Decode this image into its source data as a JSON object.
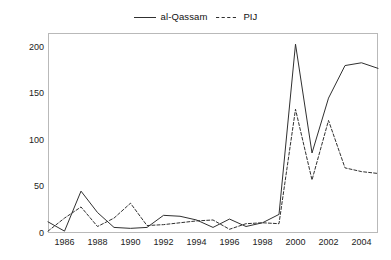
{
  "chart_data": {
    "type": "line",
    "title": "",
    "subtitle": "",
    "xlabel": "",
    "ylabel": "",
    "xlim": [
      1985,
      2005
    ],
    "ylim": [
      0,
      215
    ],
    "grid": false,
    "legend_position": "top-center",
    "x": [
      1985,
      1986,
      1987,
      1988,
      1989,
      1990,
      1991,
      1992,
      1993,
      1994,
      1995,
      1996,
      1997,
      1998,
      1999,
      2000,
      2001,
      2002,
      2003,
      2004,
      2005
    ],
    "xticks": [
      1986,
      1988,
      1990,
      1992,
      1994,
      1996,
      1998,
      2000,
      2002,
      2004
    ],
    "xtick_labels": [
      "1986",
      "1988",
      "1990",
      "1992",
      "1994",
      "1996",
      "1998",
      "2000",
      "2002",
      "2004"
    ],
    "yticks": [
      0,
      50,
      100,
      150,
      200
    ],
    "ytick_labels": [
      "0",
      "50",
      "100",
      "150",
      "200"
    ],
    "series": [
      {
        "name": "al-Qassam",
        "style": "solid",
        "color": "#303030",
        "values": [
          12,
          2,
          45,
          22,
          6,
          5,
          6,
          19,
          18,
          14,
          6,
          15,
          7,
          11,
          20,
          203,
          86,
          145,
          180,
          183,
          177
        ]
      },
      {
        "name": "PIJ",
        "style": "dashed",
        "color": "#303030",
        "values": [
          2,
          16,
          28,
          7,
          16,
          32,
          8,
          9,
          11,
          13,
          14,
          4,
          10,
          11,
          10,
          133,
          57,
          121,
          70,
          66,
          64
        ]
      }
    ]
  },
  "legend": {
    "entries": [
      {
        "label": "al-Qassam",
        "style": "solid"
      },
      {
        "label": "PIJ",
        "style": "dashed"
      }
    ]
  },
  "colors": {
    "line": "#303030",
    "frame": "#b9b9b9",
    "text": "#222222",
    "background": "#ffffff"
  }
}
